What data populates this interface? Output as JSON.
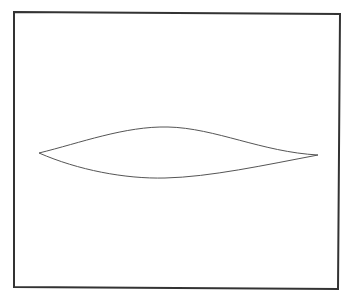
{
  "diagram": {
    "background_color": "#ffffff",
    "frame": {
      "stroke_color": "#333333",
      "stroke_width": 2,
      "points": "14,12 340,14 338,289 14,287"
    },
    "shape": {
      "type": "lens-curve",
      "stroke_color": "#555555",
      "stroke_width": 1,
      "left_tip": [
        39,
        153
      ],
      "right_tip": [
        318,
        155
      ],
      "upper_peak": [
        168,
        127
      ],
      "lower_trough": [
        165,
        178
      ],
      "upper_path": "M39,153 C80,143 125,126 168,127 C215,128 262,152 318,155",
      "lower_path": "M39,153 C78,170 125,179 165,178 C210,177 265,165 318,155"
    }
  }
}
